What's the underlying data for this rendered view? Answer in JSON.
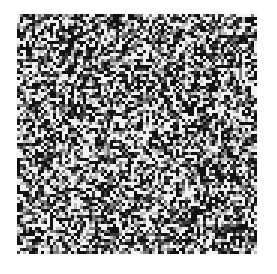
{
  "image": {
    "description": "Square random black/white/gray noise texture on white background",
    "canvas": {
      "width": 277,
      "height": 274,
      "background": "#ffffff"
    },
    "pattern": {
      "x": 17,
      "y": 14,
      "size": 240,
      "cell_px": 3,
      "palette": [
        "#111111",
        "#3a3a3a",
        "#7a7a7a",
        "#bdbdbd",
        "#f2f2f2"
      ],
      "weights": [
        0.32,
        0.12,
        0.14,
        0.12,
        0.3
      ],
      "seed": 1337
    }
  }
}
